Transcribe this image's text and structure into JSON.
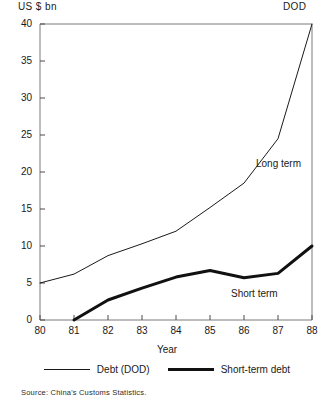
{
  "axis_unit_label": "US $ bn",
  "corner_label": "DOD",
  "xaxis_title": "Year",
  "source_note": "Source: China's Customs Statistics.",
  "annotations": {
    "long_term": "Long term",
    "short_term": "Short term"
  },
  "legend": [
    {
      "name": "Debt (DOD)",
      "style": "thin",
      "color": "#1a1a1a"
    },
    {
      "name": "Short-term debt",
      "style": "thick",
      "color": "#111111"
    }
  ],
  "chart_data": {
    "type": "line",
    "title": "",
    "subtitle": "",
    "xlabel": "Year",
    "ylabel": "US $ bn",
    "xlim": [
      80,
      88
    ],
    "ylim": [
      0,
      40
    ],
    "grid": false,
    "legend_position": "bottom",
    "x": [
      80,
      81,
      82,
      83,
      84,
      85,
      86,
      87,
      88
    ],
    "xtick_labels": [
      "80",
      "81",
      "82",
      "83",
      "84",
      "85",
      "86",
      "87",
      "88"
    ],
    "ytick_labels": [
      "0",
      "5",
      "10",
      "15",
      "20",
      "25",
      "30",
      "35",
      "40"
    ],
    "yticks": [
      0,
      5,
      10,
      15,
      20,
      25,
      30,
      35,
      40
    ],
    "series": [
      {
        "name": "Debt (DOD)",
        "annotation": "Long term",
        "values": [
          5.0,
          6.2,
          8.7,
          10.3,
          12.0,
          15.2,
          18.5,
          24.5,
          40.0
        ]
      },
      {
        "name": "Short-term debt",
        "annotation": "Short term",
        "values": [
          null,
          0.0,
          2.7,
          4.3,
          5.8,
          6.7,
          5.7,
          6.3,
          10.0
        ]
      }
    ]
  }
}
